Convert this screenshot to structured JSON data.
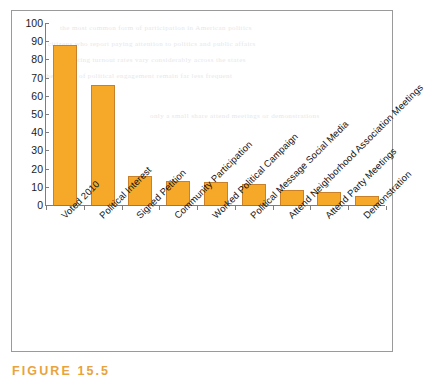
{
  "chart_data": {
    "type": "bar",
    "title": "",
    "xlabel": "",
    "ylabel": "",
    "ylim": [
      0,
      100
    ],
    "ytick_step": 10,
    "grid": false,
    "legend": "none",
    "bar_color": "#f6a829",
    "bar_border_color": "#c8802a",
    "yticks": [
      "100",
      "90",
      "80",
      "70",
      "60",
      "50",
      "40",
      "30",
      "20",
      "10",
      "0"
    ],
    "categories": [
      "Voted 2010",
      "Political Interest",
      "Signed Petition",
      "Community Participation",
      "Worked Political Campaign",
      "Political Message Social Media",
      "Attend Neighborhood Association Meetings",
      "Attend Party Meetings",
      "Demonstration"
    ],
    "values": [
      88,
      66,
      16,
      13,
      12.5,
      11.5,
      8.5,
      7,
      5
    ]
  },
  "caption": {
    "label": "FIGURE 15.5",
    "color": "#e8a33d"
  },
  "bleed_text": [
    "the most common form of participation in American politics",
    "citizens who report paying attention to politics and public affairs",
    "voting turnout rates vary considerably across the states",
    "other forms of political engagement remain far less frequent",
    "only a small share attend meetings or demonstrations"
  ]
}
